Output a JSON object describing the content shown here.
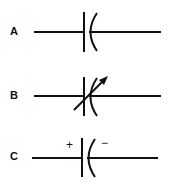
{
  "diagram": {
    "symbols": [
      {
        "label": "A",
        "type": "fixed-capacitor"
      },
      {
        "label": "B",
        "type": "variable-capacitor"
      },
      {
        "label": "C",
        "type": "polarized-capacitor",
        "positive": "+",
        "negative": "−"
      }
    ],
    "stroke_color": "#111111"
  }
}
